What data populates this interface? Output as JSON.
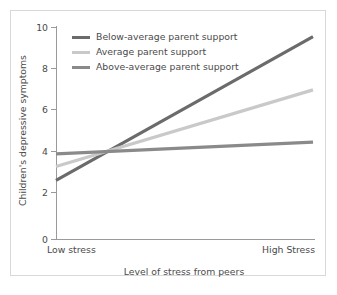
{
  "chart_data": {
    "type": "line",
    "title": "",
    "xlabel": "Level of stress from peers",
    "ylabel": "Children's depressive symptoms",
    "categories": [
      "Low stress",
      "High Stress"
    ],
    "x": [
      0,
      1
    ],
    "ylim": [
      0,
      10
    ],
    "yticks": [
      "0",
      "2",
      "4",
      "6",
      "8",
      "10"
    ],
    "ytick_values": [
      0,
      2,
      4,
      6,
      8,
      10
    ],
    "grid": false,
    "legend_position": "upper left inside plot",
    "series": [
      {
        "name": "Below-average parent support",
        "values": [
          2.75,
          9.5
        ],
        "color": "#6b6b6b"
      },
      {
        "name": "Average parent support",
        "values": [
          3.4,
          7.0
        ],
        "color": "#c9c9c9"
      },
      {
        "name": "Above-average parent support",
        "values": [
          4.0,
          4.55
        ],
        "color": "#8a8a8a"
      }
    ]
  },
  "figure": {
    "background_color": "#ffffff",
    "frame_color": "#d8d8d8",
    "axis_color": "#9a9a9a",
    "text_color": "#4a4a4a"
  }
}
